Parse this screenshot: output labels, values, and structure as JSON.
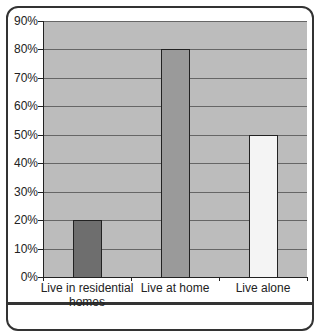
{
  "chart_data": {
    "type": "bar",
    "title": "",
    "xlabel": "",
    "ylabel": "",
    "categories": [
      "Live in residential homes",
      "Live at home",
      "Live alone"
    ],
    "category_lines": [
      [
        "Live in residential",
        "homes"
      ],
      [
        "Live at home",
        ""
      ],
      [
        "Live alone",
        ""
      ]
    ],
    "values": [
      20,
      80,
      50
    ],
    "value_unit": "%",
    "bar_colors": [
      "#6e6e6e",
      "#9a9a9a",
      "#f4f4f4"
    ],
    "ylim": [
      0,
      90
    ],
    "yticks": [
      "0%",
      "10%",
      "20%",
      "30%",
      "40%",
      "50%",
      "60%",
      "70%",
      "80%",
      "90%"
    ],
    "grid": true,
    "legend": null,
    "plot_background": "#bcbcbc"
  }
}
